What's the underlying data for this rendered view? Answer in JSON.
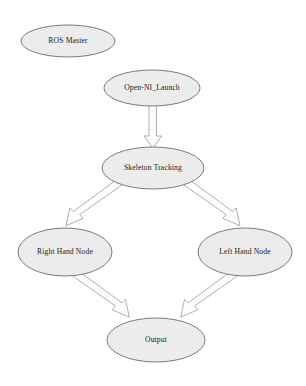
{
  "diagram": {
    "background_color": "#ffffff",
    "node_fill_color": "#ececec",
    "node_stroke_color": "#6d6d6d",
    "arrow_fill_color": "#fdfdfd",
    "arrow_stroke_color": "#9a9a9a",
    "nodes": [
      {
        "id": "ros-master",
        "label": "ROS Master",
        "cx": 68,
        "cy": 41,
        "rx": 47,
        "ry": 16
      },
      {
        "id": "open-ni-launch",
        "label": "Open-NI_Launch",
        "cx": 152,
        "cy": 88,
        "rx": 48,
        "ry": 18
      },
      {
        "id": "skeleton-tracking",
        "label": "Skeleton Tracking",
        "cx": 153,
        "cy": 168,
        "rx": 51,
        "ry": 21
      },
      {
        "id": "right-hand-node",
        "label": "Right Hand Node",
        "cx": 65,
        "cy": 252,
        "rx": 47,
        "ry": 24
      },
      {
        "id": "left-hand-node",
        "label": "Left Hand Node",
        "cx": 245,
        "cy": 252,
        "rx": 47,
        "ry": 24
      },
      {
        "id": "output",
        "label": "Output",
        "cx": 156,
        "cy": 340,
        "rx": 49,
        "ry": 22
      }
    ],
    "edges": [
      {
        "id": "launch-to-skeleton",
        "from": "open-ni-launch",
        "to": "skeleton-tracking",
        "direction": "down"
      },
      {
        "id": "skeleton-to-right-hand",
        "from": "skeleton-tracking",
        "to": "right-hand-node",
        "direction": "down-left"
      },
      {
        "id": "skeleton-to-left-hand",
        "from": "skeleton-tracking",
        "to": "left-hand-node",
        "direction": "down-right"
      },
      {
        "id": "right-hand-to-output",
        "from": "right-hand-node",
        "to": "output",
        "direction": "down-right"
      },
      {
        "id": "left-hand-to-output",
        "from": "left-hand-node",
        "to": "output",
        "direction": "down-left"
      }
    ]
  }
}
